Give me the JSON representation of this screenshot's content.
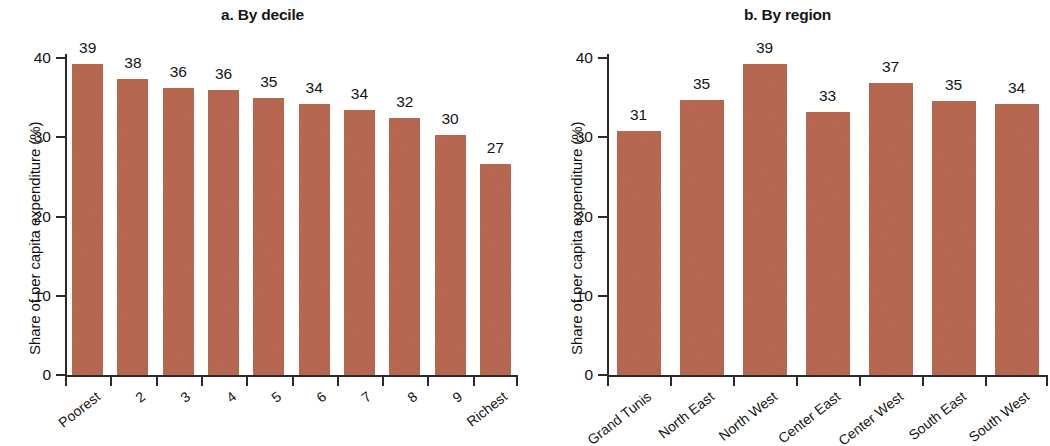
{
  "figure": {
    "background_color": "#ffffff",
    "bar_color": "#b56650",
    "axis_color": "#2a2a2a",
    "text_color": "#141414"
  },
  "panels": [
    {
      "id": "a",
      "title": "a. By decile",
      "ylabel": "Share of per capita expenditure (%)",
      "yticks": [
        "0",
        "10",
        "20",
        "30",
        "40"
      ],
      "categories": [
        "Poorest",
        "2",
        "3",
        "4",
        "5",
        "6",
        "7",
        "8",
        "9",
        "Richest"
      ],
      "labels": [
        "39",
        "38",
        "36",
        "36",
        "35",
        "34",
        "34",
        "32",
        "30",
        "27"
      ],
      "values": [
        39.2,
        37.4,
        36.2,
        36.0,
        34.9,
        34.2,
        33.5,
        32.4,
        30.3,
        26.6
      ]
    },
    {
      "id": "b",
      "title": "b. By region",
      "ylabel": "Share of per capita expenditure (%)",
      "yticks": [
        "0",
        "10",
        "20",
        "30",
        "40"
      ],
      "categories": [
        "Grand Tunis",
        "North East",
        "North West",
        "Center East",
        "Center West",
        "South East",
        "South West"
      ],
      "labels": [
        "31",
        "35",
        "39",
        "33",
        "37",
        "35",
        "34"
      ],
      "values": [
        30.8,
        34.7,
        39.2,
        33.2,
        36.8,
        34.6,
        34.2
      ]
    }
  ],
  "chart_data": [
    {
      "type": "bar",
      "title": "a. By decile",
      "xlabel": "",
      "ylabel": "Share of per capita expenditure (%)",
      "categories": [
        "Poorest",
        "2",
        "3",
        "4",
        "5",
        "6",
        "7",
        "8",
        "9",
        "Richest"
      ],
      "values": [
        39.2,
        37.4,
        36.2,
        36.0,
        34.9,
        34.2,
        33.5,
        32.4,
        30.3,
        26.6
      ],
      "data_labels": [
        "39",
        "38",
        "36",
        "36",
        "35",
        "34",
        "34",
        "32",
        "30",
        "27"
      ],
      "ylim": [
        0,
        42
      ],
      "yticks": [
        0,
        10,
        20,
        30,
        40
      ],
      "grid": false,
      "legend": "none",
      "series_color": "#b56650"
    },
    {
      "type": "bar",
      "title": "b. By region",
      "xlabel": "",
      "ylabel": "Share of per capita expenditure (%)",
      "categories": [
        "Grand Tunis",
        "North East",
        "North West",
        "Center East",
        "Center West",
        "South East",
        "South West"
      ],
      "values": [
        30.8,
        34.7,
        39.2,
        33.2,
        36.8,
        34.6,
        34.2
      ],
      "data_labels": [
        "31",
        "35",
        "39",
        "33",
        "37",
        "35",
        "34"
      ],
      "ylim": [
        0,
        42
      ],
      "yticks": [
        0,
        10,
        20,
        30,
        40
      ],
      "grid": false,
      "legend": "none",
      "series_color": "#b56650"
    }
  ]
}
